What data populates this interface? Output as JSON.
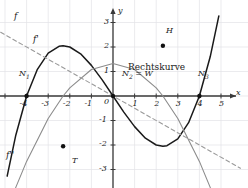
{
  "figure": {
    "kind": "function-graph",
    "background": "#ffffff",
    "grid_color": "#e2e2e6",
    "axis_color": "#3a3a3a",
    "curve_f_color": "#1a1a1a",
    "curve_fp_color": "#8c8c8c",
    "curve_fpp_color": "#9a9a9a",
    "point_color": "#111111"
  },
  "axes": {
    "x_label": "x",
    "y_label": "y",
    "x_ticks": [
      "-4",
      "-3",
      "-2",
      "-1",
      "1",
      "2",
      "3",
      "4",
      "5"
    ],
    "y_ticks": [
      "3",
      "2",
      "1",
      "-1",
      "-2",
      "-3"
    ],
    "origin_label": "0",
    "xlim": [
      -5.2,
      5.9
    ],
    "ylim": [
      -3.9,
      3.6
    ]
  },
  "annotations": {
    "f_label": "f",
    "fprime_label": "f'",
    "fdoubleprime_label": "f''",
    "zero1_label": "N",
    "zero1_sub": "1",
    "zero2_label": "N",
    "zero2_sub": "2",
    "zero2_eq": " = W",
    "zero3_label": "N",
    "zero3_sub": "3",
    "high_point_label": "H",
    "low_point_label": "T",
    "curvature_note": "Rechtskurve"
  },
  "chart_data": {
    "type": "line",
    "title": "",
    "xlabel": "x",
    "ylabel": "y",
    "xlim": [
      -5.2,
      5.9
    ],
    "ylim": [
      -3.9,
      3.6
    ],
    "grid": true,
    "legend": "inline-labels",
    "series": [
      {
        "name": "f",
        "style": "solid",
        "color": "#1a1a1a",
        "expression": "f(x) = x^3/12 - 4x/3",
        "roots": [
          -4,
          0,
          4
        ],
        "x": [
          -4.9,
          -4.5,
          -4.0,
          -3.5,
          -3.0,
          -2.5,
          -2.31,
          -2.0,
          -1.5,
          -1.0,
          -0.5,
          0.0,
          0.5,
          1.0,
          1.5,
          2.0,
          2.31,
          2.5,
          3.0,
          3.5,
          4.0,
          4.5,
          4.9
        ],
        "y": [
          -3.27,
          -1.6,
          0.0,
          1.09,
          1.75,
          2.03,
          2.05,
          2.0,
          1.72,
          1.25,
          0.66,
          0.0,
          -0.66,
          -1.25,
          -1.72,
          -2.0,
          -2.05,
          -2.03,
          -1.75,
          -1.09,
          0.0,
          1.6,
          3.27
        ]
      },
      {
        "name": "f'",
        "style": "solid-gray",
        "color": "#8c8c8c",
        "expression": "f'(x) = -x^2/4 + 4/3",
        "x": [
          -5.2,
          -4.5,
          -4.0,
          -3.0,
          -2.31,
          -2.0,
          -1.0,
          0.0,
          1.0,
          2.0,
          2.31,
          3.0,
          4.0,
          4.5,
          5.2
        ],
        "y": [
          -5.43,
          -3.73,
          -2.67,
          -0.92,
          0.0,
          0.33,
          1.08,
          1.33,
          1.08,
          0.33,
          0.0,
          -0.92,
          -2.67,
          -3.73,
          -5.43
        ]
      },
      {
        "name": "f''",
        "style": "dashed",
        "color": "#9a9a9a",
        "expression": "f''(x) = -x/2",
        "x": [
          -5.2,
          0.0,
          5.9
        ],
        "y": [
          2.6,
          0.0,
          -2.95
        ]
      }
    ],
    "points": [
      {
        "label": "N1",
        "x": -4.0,
        "y": 0.0,
        "kind": "zero"
      },
      {
        "label": "N2 = W",
        "x": 0.0,
        "y": 0.0,
        "kind": "zero-inflection"
      },
      {
        "label": "N3",
        "x": 4.0,
        "y": 0.0,
        "kind": "zero"
      },
      {
        "label": "T",
        "x": -2.31,
        "y": -2.05,
        "kind": "minimum"
      },
      {
        "label": "H",
        "x": 2.31,
        "y": 2.05,
        "kind": "maximum"
      }
    ],
    "annotations": [
      {
        "text": "Rechtskurve",
        "x": 1.0,
        "y": 0.95
      }
    ]
  }
}
